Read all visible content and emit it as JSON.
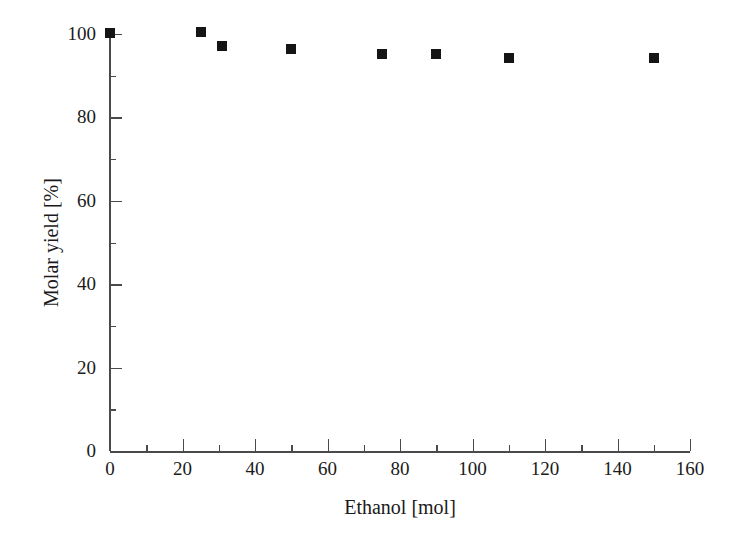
{
  "chart_data": {
    "type": "scatter",
    "title": "",
    "xlabel": "Ethanol [mol]",
    "ylabel": "Molar yield [%]",
    "xlim": [
      0,
      160
    ],
    "ylim": [
      0,
      100
    ],
    "x_major_ticks": [
      0,
      20,
      40,
      60,
      80,
      100,
      120,
      140,
      160
    ],
    "x_minor_ticks": [
      10,
      30,
      50,
      70,
      90,
      110,
      130,
      150
    ],
    "y_major_ticks": [
      0,
      20,
      40,
      60,
      80,
      100
    ],
    "y_minor_ticks": [
      10,
      30,
      50,
      70,
      90
    ],
    "x_tick_labels": [
      "0",
      "20",
      "40",
      "60",
      "80",
      "100",
      "120",
      "140",
      "160"
    ],
    "y_tick_labels": [
      "0",
      "20",
      "40",
      "60",
      "80",
      "100"
    ],
    "grid": false,
    "legend": null,
    "marker": "filled-square",
    "marker_color": "#151515",
    "axis_color": "#4a4a4a",
    "background": "#ffffff",
    "series": [
      {
        "name": "Molar yield",
        "x": [
          0,
          25,
          31,
          50,
          75,
          90,
          110,
          150
        ],
        "y": [
          100.2,
          100.4,
          97.2,
          96.3,
          95.2,
          95.2,
          94.3,
          94.2
        ]
      }
    ]
  }
}
